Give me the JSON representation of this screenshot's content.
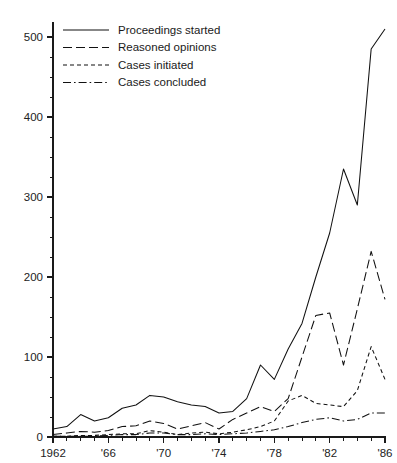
{
  "chart_data": {
    "type": "line",
    "title": "",
    "xlabel": "",
    "ylabel": "",
    "xlim": [
      1962,
      1986
    ],
    "ylim": [
      0,
      520
    ],
    "ytick_values": [
      0,
      100,
      200,
      300,
      400,
      500
    ],
    "ytick_labels": [
      "0",
      "100",
      "200",
      "300",
      "400",
      "500"
    ],
    "yminor_step": 25,
    "xtick_values": [
      1962,
      1966,
      1970,
      1974,
      1978,
      1982,
      1986
    ],
    "xtick_labels": [
      "1962",
      "'66",
      "'70",
      "'74",
      "'78",
      "'82",
      "'86"
    ],
    "xminor_step": 1,
    "grid": false,
    "legend_position": "top-left",
    "x": [
      1962,
      1963,
      1964,
      1965,
      1966,
      1967,
      1968,
      1969,
      1970,
      1971,
      1972,
      1973,
      1974,
      1975,
      1976,
      1977,
      1978,
      1979,
      1980,
      1981,
      1982,
      1983,
      1984,
      1985,
      1986
    ],
    "series": [
      {
        "name": "Proceedings started",
        "dash": "none",
        "values": [
          10,
          13,
          28,
          20,
          24,
          36,
          40,
          52,
          50,
          44,
          40,
          38,
          30,
          32,
          48,
          90,
          72,
          110,
          142,
          200,
          255,
          335,
          290,
          485,
          510
        ]
      },
      {
        "name": "Reasoned opinions",
        "dash": "long",
        "values": [
          3,
          5,
          7,
          6,
          8,
          13,
          14,
          20,
          17,
          10,
          14,
          18,
          10,
          22,
          30,
          38,
          32,
          48,
          100,
          152,
          155,
          90,
          160,
          232,
          172
        ]
      },
      {
        "name": "Cases initiated",
        "dash": "short",
        "values": [
          1,
          1,
          2,
          2,
          3,
          4,
          4,
          8,
          6,
          3,
          5,
          6,
          4,
          6,
          9,
          13,
          20,
          45,
          52,
          42,
          40,
          38,
          58,
          113,
          72
        ]
      },
      {
        "name": "Cases concluded",
        "dash": "dashdot",
        "values": [
          1,
          1,
          1,
          1,
          2,
          3,
          3,
          5,
          5,
          3,
          3,
          4,
          3,
          4,
          5,
          7,
          9,
          13,
          18,
          22,
          24,
          20,
          22,
          30,
          30
        ]
      }
    ]
  },
  "legend": {
    "items": [
      {
        "label": "Proceedings started"
      },
      {
        "label": "Reasoned opinions"
      },
      {
        "label": "Cases initiated"
      },
      {
        "label": "Cases concluded"
      }
    ]
  },
  "colors": {
    "ink": "#111111",
    "background": "#ffffff"
  }
}
